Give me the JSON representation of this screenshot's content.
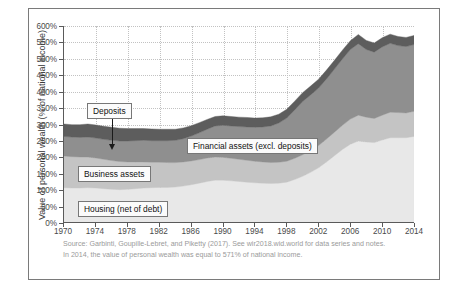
{
  "figure": {
    "y_axis_title": "Value of personal wealth (% of national income)",
    "footnote_line1": "Source: Garbinti, Goupille-Lebret, and Piketty (2017). See wir2018.wid.world for data series and notes.",
    "footnote_line2": "In 2014, the value of personal wealth was equal to 571% of national income."
  },
  "callouts": [
    {
      "id": "deposits",
      "label": "Deposits"
    },
    {
      "id": "financial",
      "label": "Financial assets (excl. deposits)"
    },
    {
      "id": "business",
      "label": "Business assets"
    },
    {
      "id": "housing",
      "label": "Housing (net of debt)"
    }
  ],
  "colors": {
    "housing": "#e8e8e8",
    "business": "#c4c4c4",
    "financial": "#8f8f8f",
    "deposits": "#5d5d5d",
    "grid": "#c2c2c2",
    "axis": "#5a5a5a",
    "frame": "#7a7a7a",
    "footnote_text": "#9a9a9a"
  },
  "chart_data": {
    "type": "area",
    "title": "",
    "xlabel": "",
    "ylabel": "Value of personal wealth (% of national income)",
    "xlim": [
      1970,
      2014
    ],
    "ylim": [
      0,
      600
    ],
    "ytick_labels": [
      "0%",
      "50%",
      "100%",
      "150%",
      "200%",
      "250%",
      "300%",
      "350%",
      "400%",
      "450%",
      "500%",
      "550%",
      "600%"
    ],
    "ytick_values": [
      0,
      50,
      100,
      150,
      200,
      250,
      300,
      350,
      400,
      450,
      500,
      550,
      600
    ],
    "xtick_labels": [
      "1970",
      "1974",
      "1978",
      "1982",
      "1986",
      "1990",
      "1994",
      "1998",
      "2002",
      "2006",
      "2010",
      "2014"
    ],
    "xtick_values": [
      1970,
      1974,
      1978,
      1982,
      1986,
      1990,
      1994,
      1998,
      2002,
      2006,
      2010,
      2014
    ],
    "grid": true,
    "stacked": true,
    "legend_position": "inline-callouts",
    "annotations": [
      "In 2014, the value of personal wealth was equal to 571% of national income."
    ],
    "x": [
      1970,
      1971,
      1972,
      1973,
      1974,
      1975,
      1976,
      1977,
      1978,
      1979,
      1980,
      1981,
      1982,
      1983,
      1984,
      1985,
      1986,
      1987,
      1988,
      1989,
      1990,
      1991,
      1992,
      1993,
      1994,
      1995,
      1996,
      1997,
      1998,
      1999,
      2000,
      2001,
      2002,
      2003,
      2004,
      2005,
      2006,
      2007,
      2008,
      2009,
      2010,
      2011,
      2012,
      2013,
      2014
    ],
    "series": [
      {
        "name": "Housing (net of debt)",
        "color": "#e8e8e8",
        "values": [
          105,
          104,
          104,
          105,
          104,
          102,
          100,
          99,
          100,
          102,
          104,
          105,
          106,
          106,
          107,
          110,
          114,
          119,
          124,
          128,
          128,
          126,
          124,
          122,
          120,
          119,
          118,
          119,
          122,
          130,
          140,
          152,
          166,
          184,
          203,
          222,
          238,
          248,
          245,
          243,
          251,
          258,
          258,
          258,
          262
        ]
      },
      {
        "name": "Business assets",
        "color": "#c4c4c4",
        "values": [
          97,
          96,
          95,
          94,
          92,
          90,
          88,
          86,
          84,
          82,
          80,
          78,
          77,
          76,
          75,
          74,
          73,
          72,
          72,
          71,
          70,
          69,
          68,
          67,
          66,
          65,
          64,
          64,
          64,
          65,
          66,
          67,
          68,
          70,
          72,
          74,
          77,
          79,
          76,
          74,
          76,
          78,
          77,
          76,
          77
        ]
      },
      {
        "name": "Financial assets (excl. deposits)",
        "color": "#8f8f8f",
        "values": [
          60,
          60,
          60,
          61,
          61,
          61,
          62,
          63,
          64,
          65,
          66,
          66,
          66,
          67,
          68,
          71,
          76,
          82,
          88,
          95,
          98,
          99,
          100,
          102,
          104,
          107,
          112,
          120,
          132,
          148,
          163,
          170,
          176,
          184,
          193,
          203,
          213,
          219,
          207,
          203,
          209,
          211,
          205,
          203,
          204
        ]
      },
      {
        "name": "Deposits",
        "color": "#5d5d5d",
        "values": [
          38,
          38,
          39,
          40,
          40,
          40,
          40,
          39,
          38,
          37,
          36,
          36,
          35,
          35,
          34,
          33,
          32,
          31,
          30,
          29,
          29,
          29,
          29,
          29,
          28,
          28,
          28,
          27,
          27,
          27,
          27,
          27,
          27,
          27,
          27,
          27,
          27,
          28,
          28,
          28,
          28,
          28,
          28,
          28,
          28
        ]
      }
    ]
  }
}
